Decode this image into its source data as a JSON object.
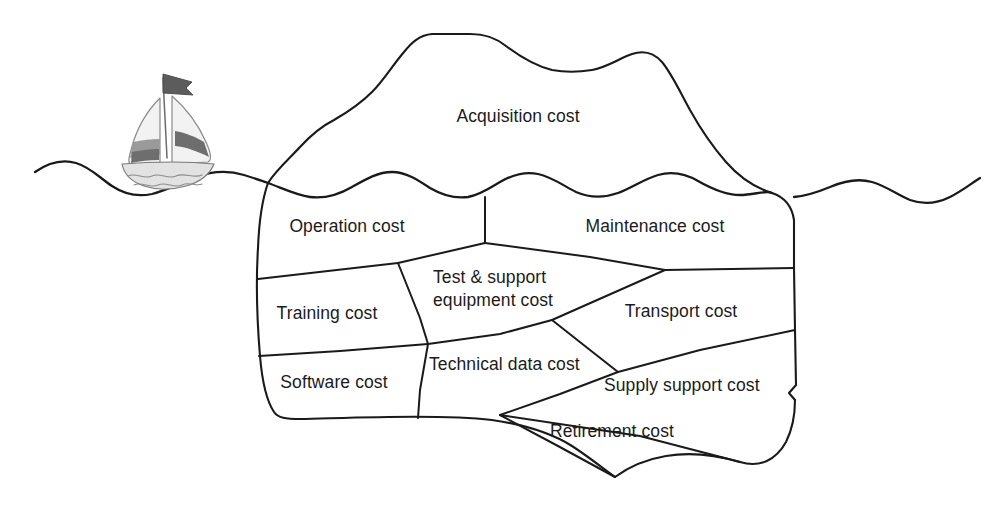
{
  "diagram": {
    "type": "iceberg-diagram",
    "background_color": "#ffffff",
    "line_color": "#1a1a1a",
    "text_color": "#1b1b1b",
    "boat_color": "#7c7c7c"
  },
  "above_water": {
    "labels": [
      {
        "id": "acquisition",
        "text": "Acquisition cost"
      }
    ]
  },
  "below_water": {
    "labels": [
      {
        "id": "operation",
        "text": "Operation cost"
      },
      {
        "id": "maintenance",
        "text": "Maintenance cost"
      },
      {
        "id": "training",
        "text": "Training cost"
      },
      {
        "id": "test_support_line1",
        "text": "Test & support"
      },
      {
        "id": "test_support_line2",
        "text": "equipment cost"
      },
      {
        "id": "transport",
        "text": "Transport cost"
      },
      {
        "id": "software",
        "text": "Software cost"
      },
      {
        "id": "technical_data",
        "text": "Technical data cost"
      },
      {
        "id": "supply_support",
        "text": "Supply support cost"
      },
      {
        "id": "retirement",
        "text": "Retirement cost"
      }
    ]
  },
  "segments": {
    "acquisition": "Acquisition cost",
    "operation": "Operation cost",
    "maintenance": "Maintenance cost",
    "training": "Training cost",
    "test_support_1": "Test & support",
    "test_support_2": "equipment cost",
    "transport": "Transport cost",
    "software": "Software cost",
    "technical_data": "Technical data cost",
    "supply_support": "Supply support cost",
    "retirement": "Retirement cost"
  },
  "decoration": {
    "sailboat": "sailboat-icon",
    "waterline": "waterline"
  }
}
